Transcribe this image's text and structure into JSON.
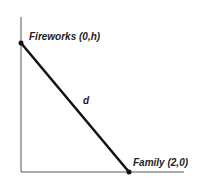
{
  "diagram": {
    "type": "coordinate-sketch",
    "points": [
      {
        "id": "fireworks",
        "label": "Fireworks (0,h)",
        "x": 0,
        "y": "h"
      },
      {
        "id": "family",
        "label": "Family (2,0)",
        "x": 2,
        "y": 0
      }
    ],
    "segment_label": "d",
    "colors": {
      "line": "#111111",
      "axis": "#555555",
      "text": "#222222"
    }
  }
}
